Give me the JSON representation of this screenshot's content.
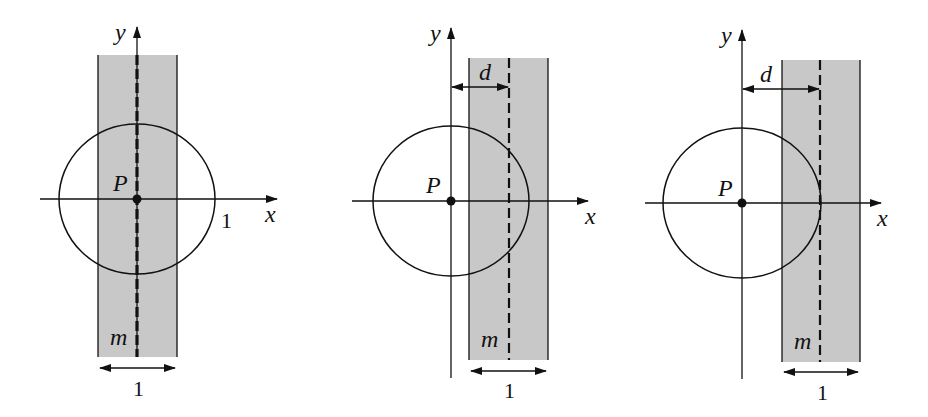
{
  "figure": {
    "colors": {
      "strip_fill": "#c8c8c8",
      "stroke": "#111111",
      "background": "#ffffff"
    },
    "panels": [
      {
        "id": "panel-1",
        "labels": {
          "y_axis": "y",
          "x_axis": "x",
          "point": "P",
          "line": "m",
          "strip_width": "1",
          "radius": "1"
        },
        "geometry": {
          "center": [
            137,
            199
          ],
          "rx": 78,
          "ry": 75,
          "strip": {
            "left": 98,
            "right": 177,
            "top": 55,
            "bottom": 357
          },
          "dashed_x": 137,
          "x_axis": {
            "x1": 40,
            "x2": 277
          },
          "y_axis": {
            "y1": 27,
            "y2": 357
          },
          "width_arrow_y": 368
        }
      },
      {
        "id": "panel-2",
        "labels": {
          "y_axis": "y",
          "x_axis": "x",
          "point": "P",
          "line": "m",
          "strip_width": "1",
          "distance": "d"
        },
        "geometry": {
          "center": [
            451,
            201
          ],
          "rx": 78,
          "ry": 75,
          "strip": {
            "left": 469,
            "right": 548,
            "top": 58,
            "bottom": 360
          },
          "dashed_x": 509,
          "x_axis": {
            "x1": 352,
            "x2": 588
          },
          "y_axis": {
            "y1": 28,
            "y2": 378
          },
          "d_arrow_y": 87,
          "width_arrow_y": 371
        }
      },
      {
        "id": "panel-3",
        "labels": {
          "y_axis": "y",
          "x_axis": "x",
          "point": "P",
          "line": "m",
          "strip_width": "1",
          "distance": "d"
        },
        "geometry": {
          "center": [
            742,
            203
          ],
          "rx": 79,
          "ry": 75,
          "strip": {
            "left": 782,
            "right": 860,
            "top": 60,
            "bottom": 362
          },
          "dashed_x": 820,
          "x_axis": {
            "x1": 645,
            "x2": 881
          },
          "y_axis": {
            "y1": 30,
            "y2": 379
          },
          "d_arrow_y": 89,
          "width_arrow_y": 372
        }
      }
    ]
  }
}
